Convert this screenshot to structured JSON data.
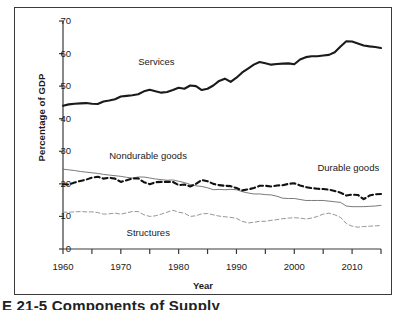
{
  "caption": "E 21-5  Components of Supply",
  "chart_data": {
    "type": "line",
    "title": "",
    "xlabel": "Year",
    "ylabel": "Percentage of GDP",
    "xlim": [
      1960,
      2015
    ],
    "ylim": [
      0,
      70
    ],
    "grid": false,
    "legend_position": "inline-annotations",
    "x_ticks_major": [
      1960,
      1970,
      1980,
      1990,
      2000,
      2010
    ],
    "x_ticks_minor": [
      1965,
      1975,
      1985,
      1995,
      2005,
      2015
    ],
    "y_ticks": [
      0,
      10,
      20,
      30,
      40,
      50,
      60,
      70
    ],
    "x": [
      1960,
      1961,
      1962,
      1963,
      1964,
      1965,
      1966,
      1967,
      1968,
      1969,
      1970,
      1971,
      1972,
      1973,
      1974,
      1975,
      1976,
      1977,
      1978,
      1979,
      1980,
      1981,
      1982,
      1983,
      1984,
      1985,
      1986,
      1987,
      1988,
      1989,
      1990,
      1991,
      1992,
      1993,
      1994,
      1995,
      1996,
      1997,
      1998,
      1999,
      2000,
      2001,
      2002,
      2003,
      2004,
      2005,
      2006,
      2007,
      2008,
      2009,
      2010,
      2011,
      2012,
      2013,
      2014,
      2015
    ],
    "series": [
      {
        "name": "Services",
        "style": "solid-thick",
        "color": "#1a1a1a",
        "values": [
          44.0,
          44.4,
          44.6,
          44.7,
          44.8,
          44.6,
          44.5,
          45.3,
          45.6,
          46.0,
          46.8,
          47.0,
          47.2,
          47.5,
          48.4,
          48.9,
          48.4,
          48.0,
          48.2,
          48.8,
          49.5,
          49.2,
          50.2,
          50.0,
          48.8,
          49.2,
          50.2,
          51.6,
          52.3,
          51.3,
          52.6,
          54.2,
          55.4,
          56.6,
          57.4,
          57.0,
          56.6,
          56.8,
          56.9,
          57.0,
          56.7,
          58.2,
          58.9,
          59.2,
          59.2,
          59.4,
          59.6,
          60.4,
          62.2,
          63.8,
          63.7,
          63.1,
          62.5,
          62.2,
          62.0,
          61.7
        ]
      },
      {
        "name": "Nondurable goods",
        "style": "solid-thin",
        "color": "#6a6a6a",
        "values": [
          24.5,
          24.3,
          24.1,
          23.8,
          23.6,
          23.4,
          23.2,
          22.9,
          22.7,
          22.5,
          22.3,
          22.0,
          21.8,
          22.1,
          22.1,
          21.8,
          21.5,
          21.3,
          21.1,
          21.2,
          20.8,
          20.4,
          19.8,
          19.4,
          19.2,
          18.8,
          18.2,
          18.3,
          18.2,
          18.3,
          18.2,
          17.6,
          17.2,
          16.9,
          16.9,
          16.7,
          16.6,
          16.2,
          15.6,
          15.5,
          15.5,
          15.2,
          14.9,
          14.9,
          14.9,
          14.9,
          14.7,
          14.5,
          14.3,
          13.2,
          13.0,
          13.0,
          13.0,
          13.1,
          13.2,
          13.4
        ]
      },
      {
        "name": "Durable goods",
        "style": "dashed-thick",
        "color": "#111111",
        "values": [
          19.9,
          19.8,
          20.4,
          20.9,
          21.3,
          21.9,
          22.2,
          21.6,
          21.9,
          21.6,
          20.6,
          21.1,
          21.6,
          21.7,
          20.5,
          19.9,
          20.5,
          20.6,
          20.6,
          20.6,
          19.6,
          19.8,
          19.2,
          20.0,
          21.2,
          20.8,
          20.0,
          19.6,
          19.4,
          19.3,
          18.7,
          18.0,
          18.3,
          18.7,
          19.4,
          19.4,
          19.2,
          19.5,
          19.6,
          20.0,
          20.2,
          19.5,
          19.0,
          18.7,
          18.5,
          18.4,
          18.2,
          17.8,
          17.3,
          16.4,
          16.7,
          16.6,
          15.3,
          16.4,
          16.8,
          16.9
        ]
      },
      {
        "name": "Structures",
        "style": "dashed-thin",
        "color": "#8a8a8a",
        "values": [
          11.3,
          11.3,
          11.4,
          11.5,
          11.4,
          11.4,
          11.2,
          10.7,
          10.8,
          11.0,
          10.7,
          11.1,
          11.5,
          11.5,
          10.5,
          10.0,
          10.2,
          10.7,
          11.3,
          11.9,
          11.3,
          11.0,
          10.0,
          10.2,
          10.8,
          10.9,
          10.5,
          10.1,
          9.9,
          9.7,
          9.4,
          8.5,
          8.0,
          8.2,
          8.5,
          8.5,
          8.8,
          9.0,
          9.3,
          9.5,
          9.6,
          9.5,
          9.2,
          9.5,
          10.0,
          10.7,
          11.0,
          10.5,
          9.7,
          7.8,
          7.0,
          6.7,
          6.9,
          7.0,
          7.1,
          7.2
        ]
      }
    ],
    "annotations": [
      {
        "text": "Services",
        "x": 1973,
        "y": 57.5
      },
      {
        "text": "Nondurable goods",
        "x": 1968,
        "y": 28.5
      },
      {
        "text": "Durable goods",
        "x": 2004,
        "y": 25.0
      },
      {
        "text": "Structures",
        "x": 1971,
        "y": 5.0
      }
    ]
  }
}
